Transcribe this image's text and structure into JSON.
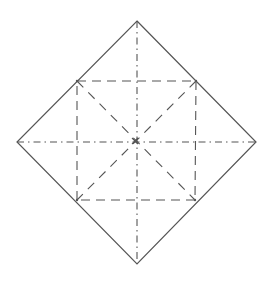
{
  "diagram": {
    "type": "origami-crease-pattern",
    "background": "#ffffff",
    "line_color": "#555555",
    "outline": {
      "shape": "square-rotated-45",
      "points": [
        [
          137,
          21
        ],
        [
          256,
          142
        ],
        [
          137,
          264
        ],
        [
          17,
          142
        ]
      ],
      "style": "solid"
    },
    "valley_folds": {
      "style": "dashed",
      "inner_square": [
        [
          77,
          81
        ],
        [
          196,
          81
        ],
        [
          195,
          200
        ],
        [
          77,
          200
        ]
      ],
      "diagonals": [
        [
          [
            77,
            81
          ],
          [
            195,
            200
          ]
        ],
        [
          [
            196,
            81
          ],
          [
            77,
            200
          ]
        ]
      ]
    },
    "mountain_folds": {
      "style": "dash-dot",
      "lines": [
        [
          [
            17,
            142
          ],
          [
            256,
            142
          ]
        ],
        [
          [
            137,
            21
          ],
          [
            137,
            264
          ]
        ]
      ]
    },
    "center": [
      135,
      141
    ]
  }
}
